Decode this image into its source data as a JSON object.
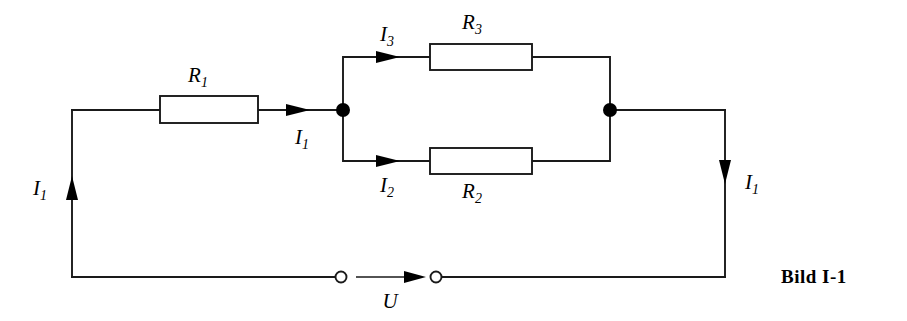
{
  "figure": {
    "caption": "Bild I-1"
  },
  "components": {
    "resistors": [
      {
        "id": "R1",
        "label": "R",
        "subscript": "1"
      },
      {
        "id": "R2",
        "label": "R",
        "subscript": "2"
      },
      {
        "id": "R3",
        "label": "R",
        "subscript": "3"
      }
    ],
    "currents": [
      {
        "id": "I1-left",
        "label": "I",
        "subscript": "1",
        "direction": "up"
      },
      {
        "id": "I1-series",
        "label": "I",
        "subscript": "1",
        "direction": "right"
      },
      {
        "id": "I1-right",
        "label": "I",
        "subscript": "1",
        "direction": "down"
      },
      {
        "id": "I2",
        "label": "I",
        "subscript": "2",
        "direction": "right"
      },
      {
        "id": "I3",
        "label": "I",
        "subscript": "3",
        "direction": "right"
      }
    ],
    "voltage": {
      "id": "U",
      "label": "U",
      "direction": "right"
    },
    "terminals": [
      {
        "id": "terminal-left"
      },
      {
        "id": "terminal-right"
      }
    ],
    "nodes": [
      {
        "id": "node-left"
      },
      {
        "id": "node-right"
      }
    ]
  },
  "colors": {
    "line": "#1a1a1a",
    "fill": "#ffffff",
    "node": "#000000",
    "background": "#ffffff"
  }
}
